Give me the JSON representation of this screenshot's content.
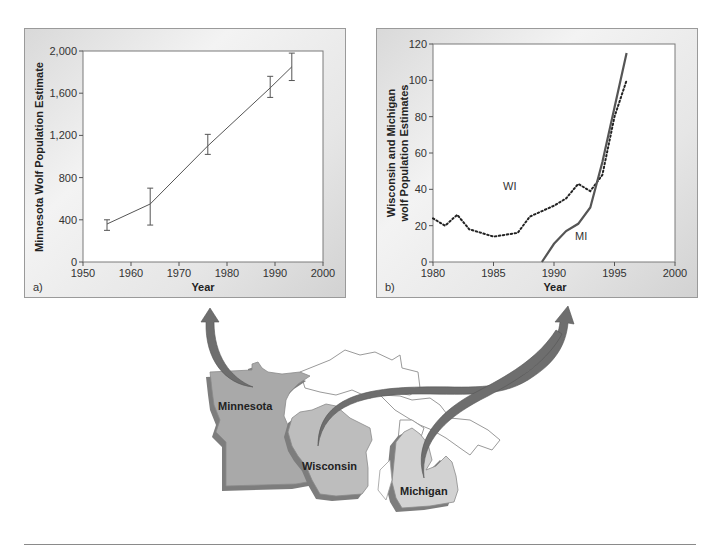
{
  "figure": {
    "panel_a": {
      "label": "a)",
      "ylabel": "Minnesota Wolf Population Estimate",
      "xlabel": "Year",
      "yticks": [
        "0",
        "400",
        "800",
        "1,200",
        "1,600",
        "2,000"
      ],
      "xticks": [
        "1950",
        "1960",
        "1970",
        "1980",
        "1990",
        "2000"
      ]
    },
    "panel_b": {
      "label": "b)",
      "ylabel_line1": "Wisconsin and Michigan",
      "ylabel_line2": "wolf Population Estimates",
      "xlabel": "Year",
      "yticks": [
        "0",
        "20",
        "40",
        "60",
        "80",
        "100",
        "120"
      ],
      "xticks": [
        "1980",
        "1985",
        "1990",
        "1995",
        "2000"
      ],
      "series_labels": {
        "wi": "WI",
        "mi": "MI"
      }
    },
    "map": {
      "states": [
        "Minnesota",
        "Wisconsin",
        "Michigan"
      ],
      "colors": {
        "minnesota": "#a9a9a9",
        "wisconsin": "#bdbdbd",
        "michigan": "#d2d2d2",
        "shadow": "#7d7d7d",
        "arrow": "#6e6e6e",
        "lake_outline": "#9a9a9a"
      }
    }
  },
  "chart_data": [
    {
      "type": "line",
      "title": "",
      "panel": "a)",
      "xlabel": "Year",
      "ylabel": "Minnesota Wolf Population Estimate",
      "xlim": [
        1950,
        2000
      ],
      "ylim": [
        0,
        2000
      ],
      "grid": false,
      "series": [
        {
          "name": "Minnesota",
          "x": [
            1955,
            1964,
            1976,
            1989,
            1993.5
          ],
          "y": [
            360,
            550,
            1100,
            1650,
            1850
          ],
          "error_low": [
            300,
            350,
            1020,
            1560,
            1720
          ],
          "error_high": [
            400,
            700,
            1210,
            1760,
            1980
          ]
        }
      ]
    },
    {
      "type": "line",
      "title": "",
      "panel": "b)",
      "xlabel": "Year",
      "ylabel": "Wisconsin and Michigan wolf Population Estimates",
      "xlim": [
        1980,
        2000
      ],
      "ylim": [
        0,
        120
      ],
      "grid": false,
      "legend": "inline labels (WI, MI)",
      "series": [
        {
          "name": "WI",
          "style": "dotted",
          "x": [
            1980,
            1981,
            1982,
            1983,
            1985,
            1987,
            1988,
            1990,
            1991,
            1992,
            1993,
            1994,
            1995,
            1996
          ],
          "y": [
            24,
            20,
            26,
            18,
            14,
            16,
            25,
            31,
            35,
            43,
            39,
            48,
            80,
            100
          ]
        },
        {
          "name": "MI",
          "style": "solid",
          "x": [
            1989,
            1990,
            1991,
            1992,
            1993,
            1994,
            1995,
            1996
          ],
          "y": [
            0,
            10,
            17,
            21,
            30,
            55,
            85,
            115
          ]
        }
      ]
    }
  ]
}
